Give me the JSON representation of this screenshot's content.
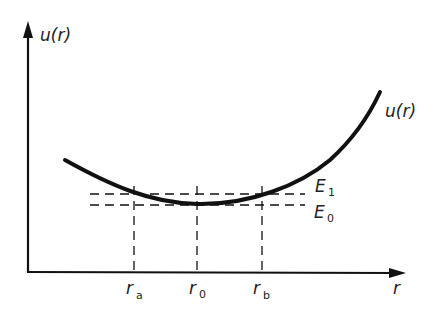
{
  "diagram": {
    "type": "potential-energy-curve",
    "y_axis_label": "u(r)",
    "x_axis_label": "r",
    "curve_label": "u(r)",
    "energy_levels": [
      {
        "name": "E",
        "sub": "1"
      },
      {
        "name": "E",
        "sub": "0"
      }
    ],
    "r_ticks": [
      {
        "name": "r",
        "sub": "a"
      },
      {
        "name": "r",
        "sub": "0"
      },
      {
        "name": "r",
        "sub": "b"
      }
    ]
  },
  "colors": {
    "ink": "#111111",
    "background": "#ffffff"
  }
}
